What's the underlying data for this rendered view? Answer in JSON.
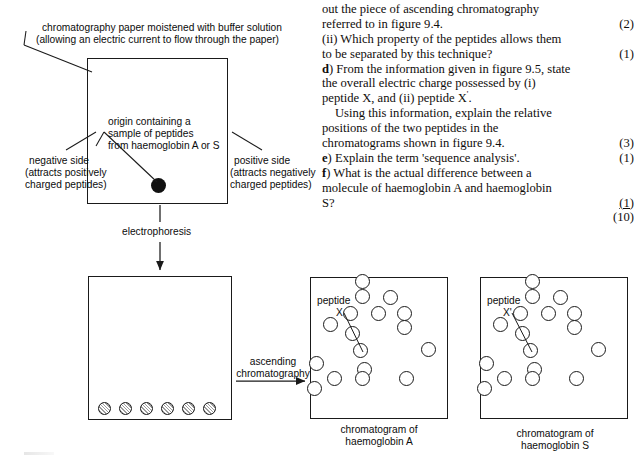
{
  "question_text": {
    "lines": [
      {
        "text": "out the piece of ascending chromatography",
        "marks": "",
        "indent": false
      },
      {
        "text": "referred to in figure 9.4.",
        "marks": "(2)",
        "indent": false
      },
      {
        "text": "(ii) Which property of the peptides allows them",
        "marks": "",
        "indent": false
      },
      {
        "text": "to be separated by this technique?",
        "marks": "(1)",
        "indent": false
      },
      {
        "text": "d) From the information given in figure 9.5, state",
        "marks": "",
        "indent": false,
        "bold_prefix": "d"
      },
      {
        "text": "the overall electric charge possessed by (i)",
        "marks": "",
        "indent": false
      },
      {
        "text": "peptide X, and (ii) peptide X'.",
        "marks": "",
        "indent": false
      },
      {
        "text": "Using this information, explain the relative",
        "marks": "",
        "indent": true
      },
      {
        "text": "positions of the two peptides in the",
        "marks": "",
        "indent": false
      },
      {
        "text": "chromatograms shown in figure 9.4.",
        "marks": "(3)",
        "indent": false
      },
      {
        "text": "e) Explain the term 'sequence analysis'.",
        "marks": "(1)",
        "indent": false,
        "bold_prefix": "e"
      },
      {
        "text": "f) What is the actual difference between a",
        "marks": "",
        "indent": false,
        "bold_prefix": "f"
      },
      {
        "text": "molecule of haemoglobin A and haemoglobin",
        "marks": "",
        "indent": false
      },
      {
        "text": "S?",
        "marks": "(1)",
        "indent": false,
        "underline_marks": true
      },
      {
        "text": "",
        "marks": "(10)",
        "indent": false
      }
    ]
  },
  "electrophoresis_diagram": {
    "paper_label_line1": "chromatography paper moistened with buffer solution",
    "paper_label_line2": "(allowing an electric current to flow through the paper)",
    "origin_label_line1": "origin containing a",
    "origin_label_line2": "sample of peptides",
    "origin_label_line3": "from haemoglobin A or S",
    "negative_line1": "negative side",
    "negative_line2": "(attracts positively",
    "negative_line3": "charged peptides)",
    "positive_line1": "positive side",
    "positive_line2": "(attracts negatively",
    "positive_line3": "charged peptides)",
    "process_label": "electrophoresis"
  },
  "ascending": {
    "label_line1": "ascending",
    "label_line2": "chromatography"
  },
  "electrophoretogram": {
    "spots_x": [
      98,
      119,
      140,
      161,
      182,
      203
    ],
    "spots_y": 402
  },
  "chromatogram_a": {
    "caption_line1": "chromatogram of",
    "caption_line2": "haemoglobin A",
    "peptide_label_line1": "peptide",
    "peptide_label_line2": "X",
    "spots": [
      [
        362,
        281
      ],
      [
        362,
        296
      ],
      [
        390,
        297
      ],
      [
        350,
        313
      ],
      [
        378,
        313
      ],
      [
        404,
        313
      ],
      [
        330,
        324
      ],
      [
        404,
        327
      ],
      [
        352,
        333
      ],
      [
        360,
        350
      ],
      [
        428,
        349
      ],
      [
        316,
        363
      ],
      [
        364,
        369
      ],
      [
        334,
        378
      ],
      [
        362,
        378
      ],
      [
        406,
        378
      ],
      [
        314,
        388
      ]
    ]
  },
  "chromatogram_s": {
    "caption_line1": "chromatogram of",
    "caption_line2": "haemoglobin S",
    "peptide_label_line1": "peptide",
    "peptide_label_line2": "X'",
    "spots": [
      [
        532,
        281
      ],
      [
        532,
        296
      ],
      [
        560,
        297
      ],
      [
        520,
        313
      ],
      [
        548,
        313
      ],
      [
        574,
        313
      ],
      [
        500,
        324
      ],
      [
        574,
        327
      ],
      [
        522,
        333
      ],
      [
        530,
        350
      ],
      [
        598,
        349
      ],
      [
        486,
        363
      ],
      [
        534,
        369
      ],
      [
        504,
        378
      ],
      [
        532,
        378
      ],
      [
        576,
        378
      ],
      [
        484,
        388
      ]
    ]
  },
  "colors": {
    "ink": "#1a1a1a",
    "text": "#0c0c0c",
    "origin_fill": "#111111",
    "spot_fill": "#ffffff",
    "paper": "#ffffff"
  }
}
